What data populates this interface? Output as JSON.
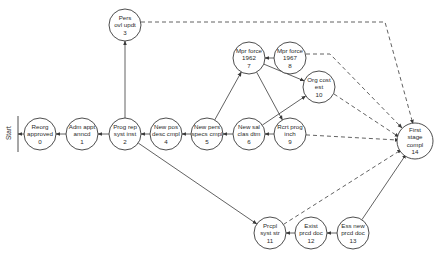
{
  "start_label": "Start",
  "nodes": [
    {
      "id": 0,
      "lines": [
        "Reorg",
        "approved",
        "0"
      ],
      "x": 40,
      "y": 134
    },
    {
      "id": 1,
      "lines": [
        "Adm appt",
        "anncd",
        "1"
      ],
      "x": 82,
      "y": 134
    },
    {
      "id": 2,
      "lines": [
        "Prog rep",
        "syst inst",
        "2"
      ],
      "x": 125,
      "y": 134
    },
    {
      "id": 3,
      "lines": [
        "Pers",
        "ovl updt",
        "3"
      ],
      "x": 125,
      "y": 25
    },
    {
      "id": 4,
      "lines": [
        "New pos",
        "desc cmpl",
        "4"
      ],
      "x": 166,
      "y": 134
    },
    {
      "id": 5,
      "lines": [
        "New pers",
        "specs cmpl",
        "5"
      ],
      "x": 207,
      "y": 134
    },
    {
      "id": 6,
      "lines": [
        "New sal",
        "clas dtm",
        "6"
      ],
      "x": 249,
      "y": 134
    },
    {
      "id": 7,
      "lines": [
        "Mpr force",
        "1962",
        "7"
      ],
      "x": 249,
      "y": 58
    },
    {
      "id": 8,
      "lines": [
        "Mpr force",
        "1967",
        "8"
      ],
      "x": 290,
      "y": 58
    },
    {
      "id": 9,
      "lines": [
        "Rcrt prog",
        "inch",
        "9"
      ],
      "x": 290,
      "y": 134
    },
    {
      "id": 10,
      "lines": [
        "Org cost",
        "est",
        "10"
      ],
      "x": 319,
      "y": 87
    },
    {
      "id": 11,
      "lines": [
        "Prcpl",
        "syst str",
        "11"
      ],
      "x": 270,
      "y": 233
    },
    {
      "id": 12,
      "lines": [
        "Exist",
        "prcd doc",
        "12"
      ],
      "x": 311,
      "y": 233
    },
    {
      "id": 13,
      "lines": [
        "Ess new",
        "prcd doc",
        "13"
      ],
      "x": 353,
      "y": 233
    },
    {
      "id": 14,
      "lines": [
        "First",
        "stage",
        "compl",
        "14"
      ],
      "x": 415,
      "y": 141
    }
  ],
  "edges": [
    {
      "from": 0,
      "to": "start",
      "style": "solid"
    },
    {
      "from": 1,
      "to": 0,
      "style": "solid"
    },
    {
      "from": 2,
      "to": 1,
      "style": "solid"
    },
    {
      "from": 2,
      "to": 3,
      "style": "solid"
    },
    {
      "from": 4,
      "to": 2,
      "style": "solid"
    },
    {
      "from": 5,
      "to": 4,
      "style": "solid"
    },
    {
      "from": 6,
      "to": 5,
      "style": "solid"
    },
    {
      "from": 5,
      "to": 7,
      "style": "solid"
    },
    {
      "from": 8,
      "to": 7,
      "style": "solid"
    },
    {
      "from": 7,
      "to": 10,
      "style": "solid"
    },
    {
      "from": 7,
      "to": 9,
      "style": "solid"
    },
    {
      "from": 6,
      "to": 10,
      "style": "solid"
    },
    {
      "from": 9,
      "to": 6,
      "style": "solid"
    },
    {
      "from": 2,
      "to": 11,
      "style": "solid"
    },
    {
      "from": 12,
      "to": 11,
      "style": "solid"
    },
    {
      "from": 13,
      "to": 12,
      "style": "solid"
    },
    {
      "from": 13,
      "to": 14,
      "style": "solid"
    },
    {
      "from": 3,
      "to": 14,
      "style": "dashed"
    },
    {
      "from": 8,
      "to": 14,
      "style": "dashed"
    },
    {
      "from": 10,
      "to": 14,
      "style": "dashed"
    },
    {
      "from": 9,
      "to": 14,
      "style": "dashed"
    },
    {
      "from": 11,
      "to": 14,
      "style": "dashed"
    }
  ]
}
